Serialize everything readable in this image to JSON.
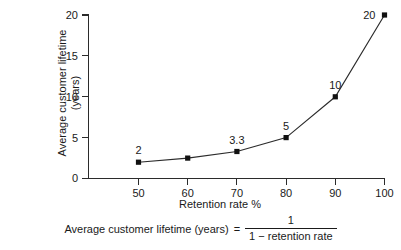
{
  "chart_data": {
    "type": "line",
    "title": "",
    "xlabel": "Retention rate %",
    "ylabel_line1": "Average customer lifetime",
    "ylabel_line2": "(years)",
    "xlim": [
      45,
      102
    ],
    "ylim": [
      0,
      20
    ],
    "grid": false,
    "legend": "none",
    "x_ticks": [
      "50",
      "60",
      "70",
      "80",
      "90",
      "100"
    ],
    "x_tick_values": [
      50,
      60,
      70,
      80,
      90,
      100
    ],
    "y_ticks": [
      "0",
      "5",
      "10",
      "15",
      "20"
    ],
    "y_tick_values": [
      0,
      5,
      10,
      15,
      20
    ],
    "x": [
      50,
      60,
      70,
      80,
      90,
      100
    ],
    "values": [
      2,
      2.5,
      3.3,
      5,
      10,
      20
    ],
    "point_labels": [
      "2",
      "",
      "3.3",
      "5",
      "10",
      "20"
    ],
    "marker": "square",
    "marker_color": "#111111",
    "line_color": "#2b2b2b",
    "series": [
      {
        "name": "Average customer lifetime",
        "values": [
          2,
          2.5,
          3.3,
          5,
          10,
          20
        ]
      }
    ]
  },
  "formula": {
    "lhs": "Average customer lifetime (years)",
    "equals": "=",
    "numerator": "1",
    "denominator": "1  −  retention rate"
  }
}
